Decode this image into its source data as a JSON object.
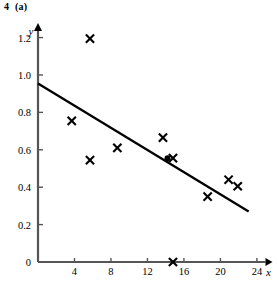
{
  "figure": {
    "label": "4  (a)"
  },
  "chart_data": {
    "type": "scatter",
    "title": "",
    "subtitle": "",
    "xlabel": "x",
    "ylabel": "y",
    "xlim": [
      0,
      25.6
    ],
    "ylim": [
      0,
      1.3
    ],
    "grid": false,
    "legend": null,
    "x_ticks": [
      4,
      8,
      12,
      16,
      20,
      24
    ],
    "x_tick_labels": [
      "4",
      "8",
      "12",
      "16",
      "20",
      "24"
    ],
    "y_ticks": [
      0,
      0.2,
      0.4,
      0.6,
      0.8,
      1.0,
      1.2
    ],
    "y_tick_labels": [
      "0",
      "0.2",
      "0.4",
      "0.6",
      "0.8",
      "1.0",
      "1.2"
    ],
    "series": [
      {
        "name": "data-points",
        "marker": "cross",
        "color": "#000000",
        "points": [
          {
            "x": 3.7,
            "y": 0.755
          },
          {
            "x": 5.7,
            "y": 1.195
          },
          {
            "x": 5.7,
            "y": 0.545
          },
          {
            "x": 8.7,
            "y": 0.61
          },
          {
            "x": 13.7,
            "y": 0.665
          },
          {
            "x": 14.8,
            "y": 0.555
          },
          {
            "x": 14.8,
            "y": 0.0
          },
          {
            "x": 18.6,
            "y": 0.35
          },
          {
            "x": 20.9,
            "y": 0.44
          },
          {
            "x": 21.9,
            "y": 0.405
          }
        ]
      },
      {
        "name": "mean-point",
        "marker": "filled-circle",
        "color": "#000000",
        "points": [
          {
            "x": 14.2,
            "y": 0.555
          }
        ]
      }
    ],
    "fit_line": {
      "name": "regression-line",
      "color": "#000000",
      "x_start": 0.0,
      "y_start": 0.955,
      "x_end": 23.1,
      "y_end": 0.27
    }
  }
}
